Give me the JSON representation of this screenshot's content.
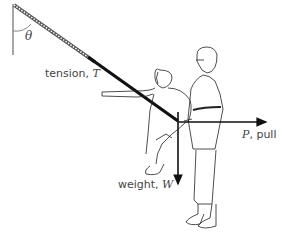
{
  "diagram": {
    "type": "free-body force diagram",
    "angle_label": "θ",
    "forces": [
      {
        "name": "tension",
        "symbol": "T",
        "label_text": "tension, ",
        "direction": "up-left along rope"
      },
      {
        "name": "pull",
        "symbol": "P",
        "label_text": ", pull",
        "direction": "right"
      },
      {
        "name": "weight",
        "symbol": "W",
        "label_text": "weight, ",
        "direction": "down"
      }
    ],
    "figures": [
      "seated person on rope swing",
      "standing person pulling"
    ],
    "colors": {
      "arrow": "#111111",
      "text": "#444444",
      "wall": "#888888",
      "sketch": "#222222"
    }
  }
}
